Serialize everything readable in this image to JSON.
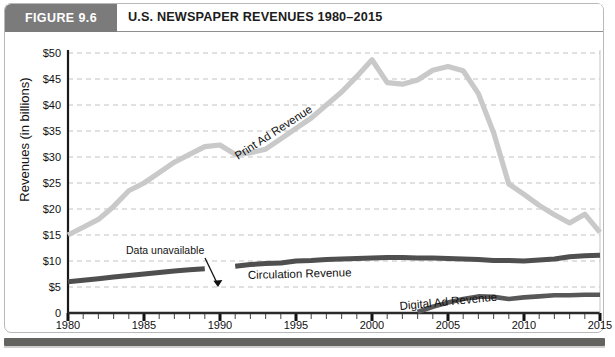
{
  "figure": {
    "badge": "FIGURE 9.6",
    "title": "U.S. NEWSPAPER REVENUES 1980–2015"
  },
  "annotations": {
    "data_unavailable": "Data unavailable"
  },
  "chart_data": {
    "type": "line",
    "title": "U.S. NEWSPAPER REVENUES 1980–2015",
    "xlabel": "",
    "ylabel": "Revenues (in billions)",
    "xlim": [
      1980,
      2015
    ],
    "ylim": [
      0,
      50
    ],
    "grid": true,
    "grid_style": "dashed-horizontal",
    "legend": "inline-labels",
    "ytick_labels": [
      "$50",
      "$45",
      "$40",
      "$35",
      "$30",
      "$25",
      "$20",
      "$15",
      "$10",
      "$5",
      "0"
    ],
    "ytick_values": [
      50,
      45,
      40,
      35,
      30,
      25,
      20,
      15,
      10,
      5,
      0
    ],
    "xtick_labels": [
      "1980",
      "1985",
      "1990",
      "1995",
      "2000",
      "2005",
      "2010",
      "2015"
    ],
    "xtick_values": [
      1980,
      1985,
      1990,
      1995,
      2000,
      2005,
      2010,
      2015
    ],
    "minor_xticks": "every 1 year",
    "x": [
      1980,
      1981,
      1982,
      1983,
      1984,
      1985,
      1986,
      1987,
      1988,
      1989,
      1990,
      1991,
      1992,
      1993,
      1994,
      1995,
      1996,
      1997,
      1998,
      1999,
      2000,
      2001,
      2002,
      2003,
      2004,
      2005,
      2006,
      2007,
      2008,
      2009,
      2010,
      2011,
      2012,
      2013,
      2014,
      2015
    ],
    "series": [
      {
        "name": "Print Ad Revenue",
        "label": "Print Ad Revenue",
        "color": "#c9c9c9",
        "values": [
          15.0,
          16.5,
          18.0,
          20.5,
          23.5,
          25.0,
          27.0,
          29.0,
          30.5,
          32.0,
          32.3,
          30.5,
          30.8,
          31.5,
          33.5,
          35.5,
          37.5,
          40.0,
          42.5,
          45.5,
          48.7,
          44.3,
          44.0,
          44.8,
          46.7,
          47.4,
          46.6,
          42.2,
          34.7,
          24.8,
          22.8,
          20.7,
          18.9,
          17.3,
          19.0,
          15.5
        ],
        "unit": "billions of dollars"
      },
      {
        "name": "Circulation Revenue",
        "label": "Circulation Revenue",
        "color": "#4f4f4f",
        "gap": {
          "from": 1989,
          "to": 1991,
          "note": "Data unavailable"
        },
        "values": [
          6.0,
          6.3,
          6.6,
          6.9,
          7.2,
          7.5,
          7.8,
          8.1,
          8.3,
          8.5,
          null,
          9.0,
          9.3,
          9.5,
          9.6,
          10.0,
          10.1,
          10.3,
          10.4,
          10.5,
          10.6,
          10.7,
          10.7,
          10.6,
          10.6,
          10.5,
          10.4,
          10.3,
          10.1,
          10.1,
          10.0,
          10.2,
          10.4,
          10.8,
          11.0,
          11.1
        ],
        "unit": "billions of dollars"
      },
      {
        "name": "Digital Ad Revenue",
        "label": "Digital Ad Revenue",
        "color": "#585858",
        "values": [
          null,
          null,
          null,
          null,
          null,
          null,
          null,
          null,
          null,
          null,
          null,
          null,
          null,
          null,
          null,
          null,
          null,
          null,
          null,
          null,
          null,
          null,
          null,
          0.2,
          1.2,
          2.0,
          2.7,
          3.2,
          3.1,
          2.7,
          3.0,
          3.2,
          3.4,
          3.4,
          3.5,
          3.5
        ],
        "unit": "billions of dollars"
      }
    ]
  }
}
